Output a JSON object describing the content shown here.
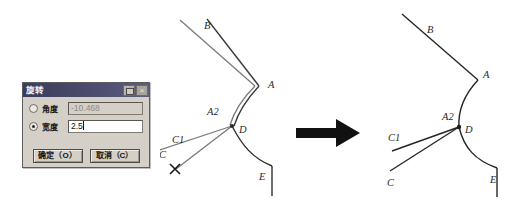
{
  "dialog": {
    "title": "旋转",
    "titlebar_buttons": [
      {
        "name": "restore",
        "glyph": ""
      },
      {
        "name": "close",
        "glyph": "×"
      }
    ],
    "fields": [
      {
        "label": "角度",
        "value": "-10.468",
        "selected": false,
        "enabled": false
      },
      {
        "label": "宽度",
        "value": "2.5",
        "selected": true,
        "enabled": true
      }
    ],
    "buttons": {
      "ok": "确定（O）",
      "cancel": "取消（C）"
    }
  },
  "arrow": {
    "label": "transform-arrow",
    "color": "#111111"
  },
  "diagram_before": {
    "caption": "before",
    "labels": {
      "B": "B",
      "A": "A",
      "A2": "A2",
      "D": "D",
      "C1": "C1",
      "C": "C",
      "E": "E"
    },
    "marker": "✕",
    "line_color": "#3a3a3a",
    "ghost_color": "#6f6f6f"
  },
  "diagram_after": {
    "caption": "after",
    "labels": {
      "B": "B",
      "A": "A",
      "A2": "A2",
      "D": "D",
      "C1": "C1",
      "C": "C",
      "E": "E"
    },
    "line_color": "#262626"
  }
}
